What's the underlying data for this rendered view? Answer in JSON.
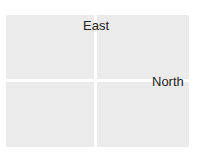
{
  "chart_data": {
    "type": "scatter",
    "title": "",
    "xlabel": "",
    "ylabel": "",
    "grid": true,
    "panel_background": "#ebebeb",
    "gridline_color": "#ffffff",
    "annotations": [
      {
        "text": "East",
        "position": "top-center"
      },
      {
        "text": "North",
        "position": "right-middle"
      }
    ],
    "points": []
  },
  "labels": {
    "east": "East",
    "north": "North"
  }
}
